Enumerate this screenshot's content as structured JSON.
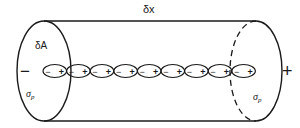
{
  "diagram": {
    "labels": {
      "length": "δx",
      "area": "δA",
      "left_charge": "−",
      "right_charge": "+",
      "left_surface_charge": "σp",
      "right_surface_charge": "σp",
      "sigma": "σ",
      "sigma_sub": "p"
    },
    "dipoles": {
      "count": 9,
      "items": [
        {
          "neg": "−",
          "pos": "+"
        },
        {
          "neg": "−",
          "pos": "+"
        },
        {
          "neg": "−",
          "pos": "+"
        },
        {
          "neg": "−",
          "pos": "+"
        },
        {
          "neg": "−",
          "pos": "+"
        },
        {
          "neg": "−",
          "pos": "+"
        },
        {
          "neg": "−",
          "pos": "+"
        },
        {
          "neg": "−",
          "pos": "+"
        },
        {
          "neg": "−",
          "pos": "+"
        }
      ]
    },
    "colors": {
      "stroke": "#1a1a1a",
      "background": "#ffffff"
    }
  }
}
